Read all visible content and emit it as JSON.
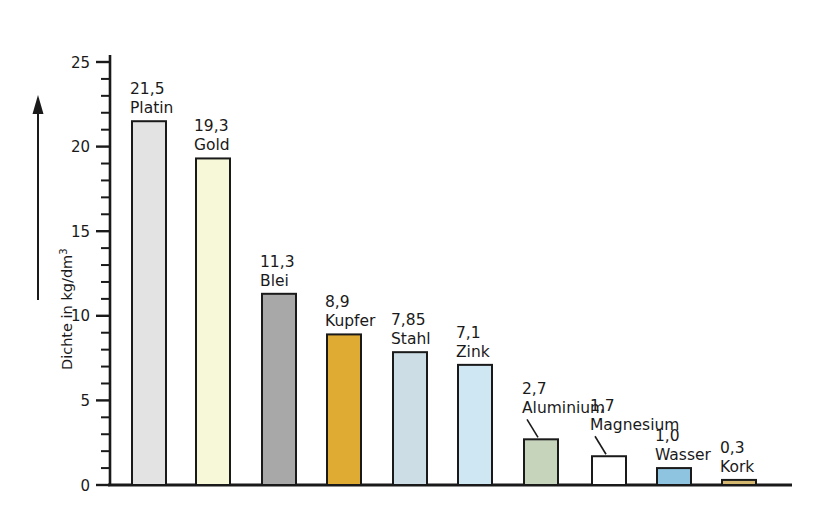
{
  "chart_data": {
    "type": "bar",
    "title": "",
    "subtitle": "",
    "xlabel": "",
    "ylabel": "Dichte in kg/dm",
    "ylabel_exponent": "3",
    "ylabel_full": "Dichte in kg/dm³",
    "unit": "kg/dm³",
    "ylim": [
      0,
      25
    ],
    "y_major_step": 5,
    "y_minor_step": 1,
    "grid": false,
    "legend": "none",
    "axis_style": "arrow-up-left-of-axis",
    "tick_labels": [
      "0",
      "5",
      "10",
      "15",
      "20",
      "25"
    ],
    "tick_values": [
      0,
      5,
      10,
      15,
      20,
      25
    ],
    "categories": [
      "Platin",
      "Gold",
      "Blei",
      "Kupfer",
      "Stahl",
      "Zink",
      "Aluminium",
      "Magnesium",
      "Wasser",
      "Kork"
    ],
    "values": [
      21.5,
      19.3,
      11.3,
      8.9,
      7.85,
      7.1,
      2.7,
      1.7,
      1.0,
      0.3
    ],
    "value_labels": [
      "21,5",
      "19,3",
      "11,3",
      "8,9",
      "7,85",
      "7,1",
      "2,7",
      "1,7",
      "1,0",
      "0,3"
    ],
    "bars": [
      {
        "name": "Platin",
        "value": 21.5,
        "value_label": "21,5",
        "color": "#e3e3e3",
        "x": 132,
        "width": 34,
        "leader": false
      },
      {
        "name": "Gold",
        "value": 19.3,
        "value_label": "19,3",
        "color": "#f7f8d8",
        "x": 196,
        "width": 34,
        "leader": false
      },
      {
        "name": "Blei",
        "value": 11.3,
        "value_label": "11,3",
        "color": "#a8a8a8",
        "x": 262,
        "width": 34,
        "leader": false
      },
      {
        "name": "Kupfer",
        "value": 8.9,
        "value_label": "8,9",
        "color": "#e0ab32",
        "x": 327,
        "width": 34,
        "leader": false
      },
      {
        "name": "Stahl",
        "value": 7.85,
        "value_label": "7,85",
        "color": "#cddde5",
        "x": 393,
        "width": 34,
        "leader": false
      },
      {
        "name": "Zink",
        "value": 7.1,
        "value_label": "7,1",
        "color": "#cfe7f2",
        "x": 458,
        "width": 34,
        "leader": false
      },
      {
        "name": "Aluminium",
        "value": 2.7,
        "value_label": "2,7",
        "color": "#c6d4bc",
        "x": 524,
        "width": 34,
        "leader": true
      },
      {
        "name": "Magnesium",
        "value": 1.7,
        "value_label": "1,7",
        "color": "#ffffff",
        "x": 592,
        "width": 34,
        "leader": true
      },
      {
        "name": "Wasser",
        "value": 1.0,
        "value_label": "1,0",
        "color": "#8fc4e0",
        "x": 657,
        "width": 34,
        "leader": false
      },
      {
        "name": "Kork",
        "value": 0.3,
        "value_label": "0,3",
        "color": "#d4b870",
        "x": 722,
        "width": 34,
        "leader": false
      }
    ],
    "colors": {
      "Platin": "#e3e3e3",
      "Gold": "#f7f8d8",
      "Blei": "#a8a8a8",
      "Kupfer": "#e0ab32",
      "Stahl": "#cddde5",
      "Zink": "#cfe7f2",
      "Aluminium": "#c6d4bc",
      "Magnesium": "#ffffff",
      "Wasser": "#8fc4e0",
      "Kork": "#d4b870",
      "outline": "#1a1a1a",
      "background": "#ffffff",
      "text": "#1a1a1a"
    }
  }
}
